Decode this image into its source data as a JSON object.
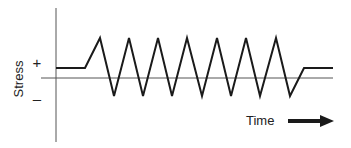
{
  "diagram": {
    "type": "stress-time waveform",
    "y_axis_label": "Stress",
    "positive_sign": "+",
    "negative_sign": "–",
    "x_axis_label": "Time",
    "colors": {
      "line": "#1a1a1a",
      "axis": "#555555",
      "background": "#ffffff"
    },
    "waveform_points": [
      [
        56,
        68
      ],
      [
        85,
        68
      ],
      [
        100,
        38
      ],
      [
        114,
        96
      ],
      [
        129,
        38
      ],
      [
        143,
        96
      ],
      [
        158,
        38
      ],
      [
        172,
        96
      ],
      [
        187,
        38
      ],
      [
        202,
        96
      ],
      [
        217,
        38
      ],
      [
        231,
        96
      ],
      [
        246,
        38
      ],
      [
        260,
        96
      ],
      [
        276,
        38
      ],
      [
        290,
        96
      ],
      [
        304,
        68
      ],
      [
        333,
        68
      ]
    ],
    "cycles": 7
  }
}
